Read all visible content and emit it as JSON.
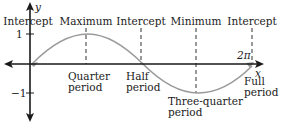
{
  "diagram": {
    "type": "sine-wave-period-diagram",
    "function": "y = sin(x)",
    "axes": {
      "x_label": "x",
      "y_label": "y",
      "y_ticks": [
        "1",
        "−1"
      ],
      "x_tick_label": "2π"
    },
    "top_labels": [
      {
        "id": "intercept-start",
        "text": "Intercept"
      },
      {
        "id": "maximum",
        "text": "Maximum"
      },
      {
        "id": "intercept-mid",
        "text": "Intercept"
      },
      {
        "id": "minimum",
        "text": "Minimum"
      },
      {
        "id": "intercept-end",
        "text": "Intercept"
      }
    ],
    "period_labels": [
      {
        "id": "quarter",
        "line1": "Quarter",
        "line2": "period"
      },
      {
        "id": "half",
        "line1": "Half",
        "line2": "period"
      },
      {
        "id": "three-quarter",
        "line1": "Three-quarter",
        "line2": "period"
      },
      {
        "id": "full",
        "line1": "Full",
        "line2": "period"
      }
    ],
    "colors": {
      "axis": "#1a1a1a",
      "curve": "#9a9a9a",
      "dashed": "#333333",
      "text": "#1a1a1a"
    }
  }
}
